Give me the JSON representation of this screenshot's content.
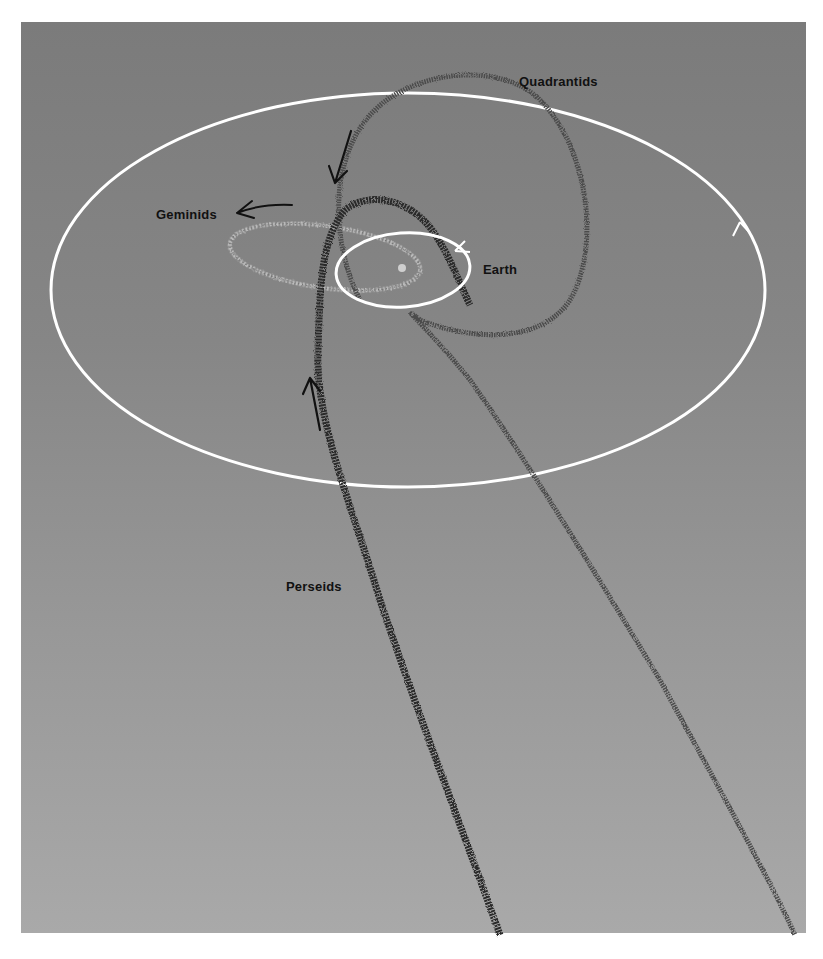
{
  "diagram": {
    "background_colors": {
      "top": "#7b7b7b",
      "bottom": "#a9a9a9"
    },
    "stream_color": "#2a2a2a",
    "orbit_color": "#ffffff",
    "labels": {
      "quadrantids": "Quadrantids",
      "geminids": "Geminids",
      "earth": "Earth",
      "perseids": "Perseids"
    },
    "elements": [
      {
        "name": "outer-orbit",
        "shape": "large white ellipse",
        "direction_arrow": "counter-clockwise"
      },
      {
        "name": "earth-orbit",
        "shape": "small white ellipse around Sun",
        "direction_arrow": "counter-clockwise"
      },
      {
        "name": "sun",
        "shape": "small light dot at center"
      },
      {
        "name": "geminids-stream",
        "shape": "small light-edged ellipse",
        "direction_arrow": "left"
      },
      {
        "name": "quadrantids-stream",
        "shape": "looping dark stream, tail down-right",
        "direction_arrow": "down-left"
      },
      {
        "name": "perseids-stream",
        "shape": "long dark stream, loop near Sun, tail down",
        "direction_arrow": "up"
      }
    ]
  }
}
